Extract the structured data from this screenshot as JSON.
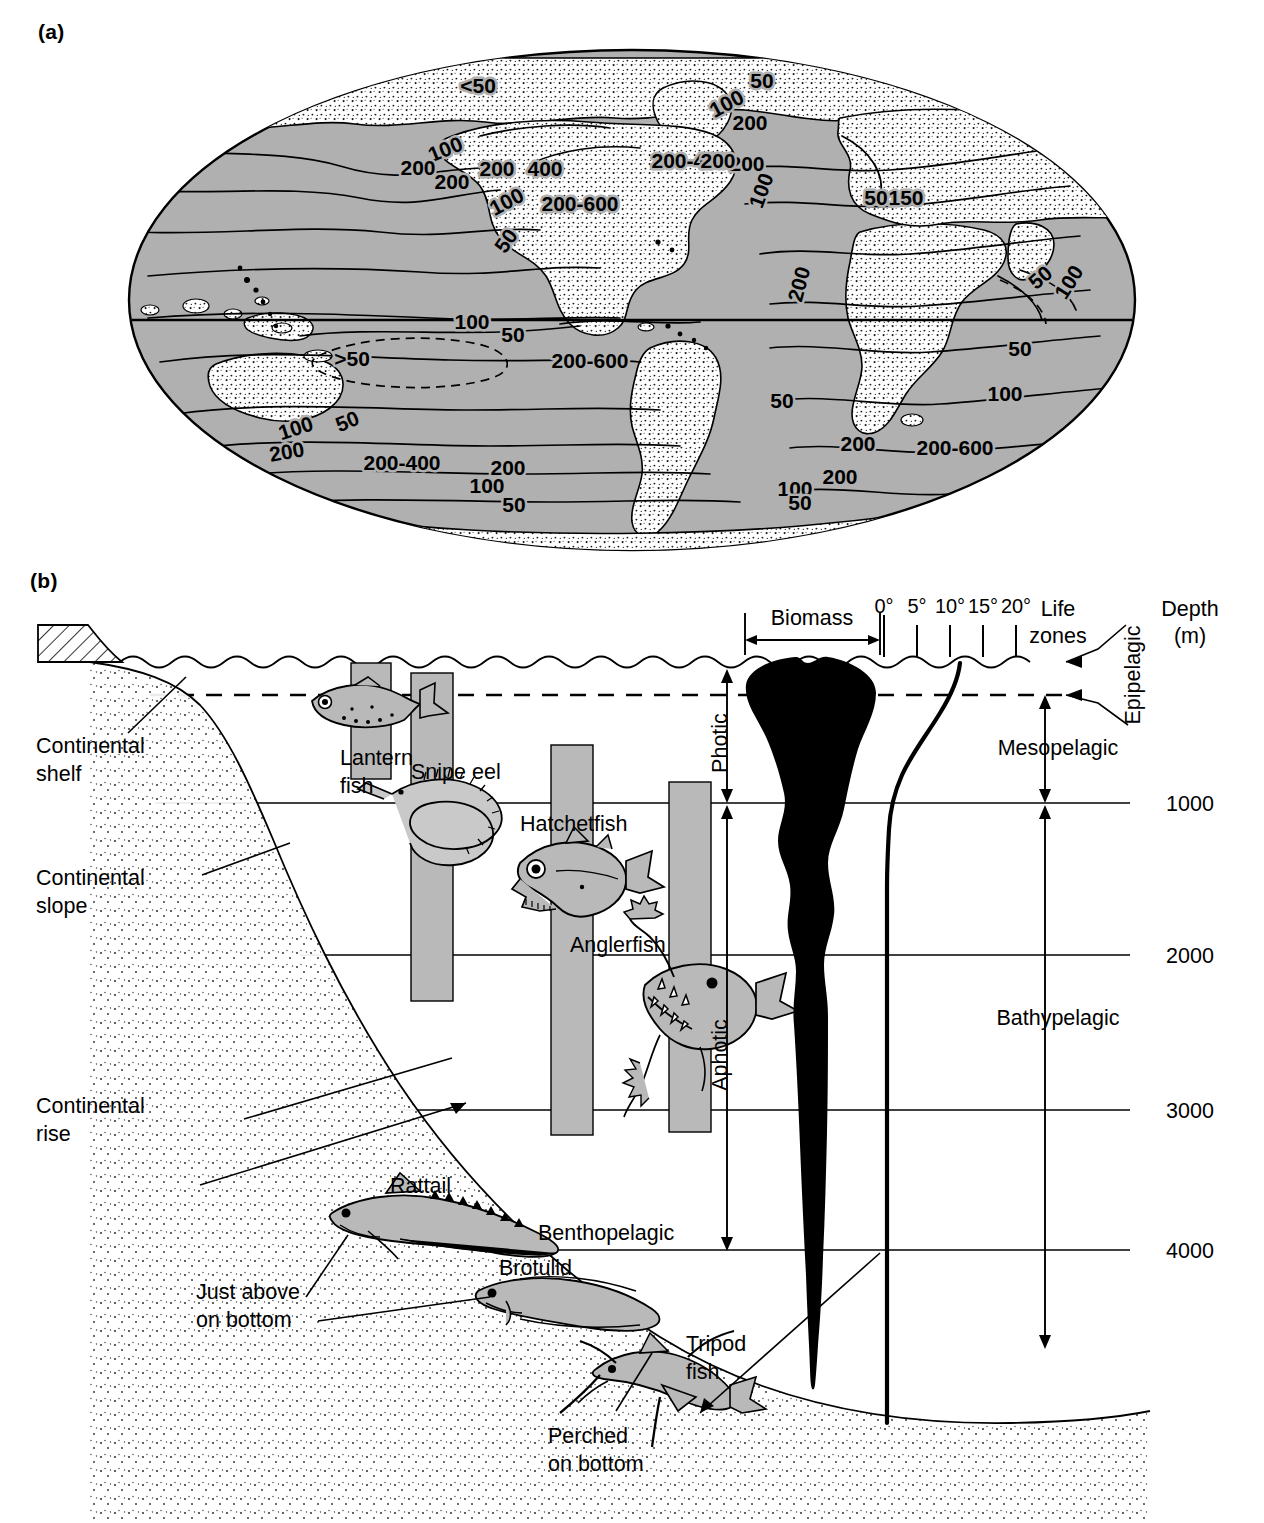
{
  "figure": {
    "panel_a_label": "(a)",
    "panel_b_label": "(b)"
  },
  "panel_a": {
    "description": "World map of annual primary productivity (gC/m2/yr) with contour lines",
    "contour_labels": [
      {
        "id": "c1",
        "text": "<50",
        "x": 478,
        "y": 75,
        "rotate": 0
      },
      {
        "id": "c2",
        "text": "50",
        "x": 762,
        "y": 70,
        "rotate": 0
      },
      {
        "id": "c3",
        "text": "100",
        "x": 730,
        "y": 92,
        "rotate": -28
      },
      {
        "id": "c4",
        "text": "200",
        "x": 750,
        "y": 112,
        "rotate": 0
      },
      {
        "id": "c5",
        "text": "100",
        "x": 448,
        "y": 138,
        "rotate": -22
      },
      {
        "id": "c6",
        "text": "200",
        "x": 418,
        "y": 157,
        "rotate": 0
      },
      {
        "id": "c7",
        "text": "200",
        "x": 452,
        "y": 171,
        "rotate": 0
      },
      {
        "id": "c8",
        "text": "200",
        "x": 497,
        "y": 158,
        "rotate": 0
      },
      {
        "id": "c9",
        "text": "400",
        "x": 545,
        "y": 158,
        "rotate": 0
      },
      {
        "id": "c10",
        "text": "200-400",
        "x": 690,
        "y": 150,
        "rotate": 0
      },
      {
        "id": "c11",
        "text": "200",
        "x": 747,
        "y": 153,
        "rotate": 0
      },
      {
        "id": "c12",
        "text": "100",
        "x": 510,
        "y": 190,
        "rotate": -28
      },
      {
        "id": "c13",
        "text": "200-600",
        "x": 580,
        "y": 193,
        "rotate": 0
      },
      {
        "id": "c14",
        "text": "100",
        "x": 768,
        "y": 175,
        "rotate": -70
      },
      {
        "id": "c15",
        "text": "50",
        "x": 512,
        "y": 227,
        "rotate": -55
      },
      {
        "id": "c16",
        "text": "50",
        "x": 876,
        "y": 187,
        "rotate": 0
      },
      {
        "id": "c17",
        "text": "150",
        "x": 906,
        "y": 187,
        "rotate": 0
      },
      {
        "id": "c18",
        "text": "200",
        "x": 806,
        "y": 268,
        "rotate": -75
      },
      {
        "id": "c19",
        "text": "50",
        "x": 1045,
        "y": 265,
        "rotate": -40
      },
      {
        "id": "c20",
        "text": "100",
        "x": 1075,
        "y": 268,
        "rotate": -58
      },
      {
        "id": "c21",
        "text": "100",
        "x": 472,
        "y": 311,
        "rotate": 0
      },
      {
        "id": "c22",
        "text": "50",
        "x": 513,
        "y": 324,
        "rotate": 0
      },
      {
        "id": "c23",
        "text": ">50",
        "x": 352,
        "y": 348,
        "rotate": 0
      },
      {
        "id": "c24",
        "text": "200-600",
        "x": 590,
        "y": 350,
        "rotate": 0
      },
      {
        "id": "c25",
        "text": "50",
        "x": 350,
        "y": 410,
        "rotate": -22
      },
      {
        "id": "c26",
        "text": "100",
        "x": 298,
        "y": 417,
        "rotate": -18
      },
      {
        "id": "c27",
        "text": "200",
        "x": 288,
        "y": 441,
        "rotate": -10
      },
      {
        "id": "c28",
        "text": "200-400",
        "x": 402,
        "y": 452,
        "rotate": 0
      },
      {
        "id": "c29",
        "text": "200",
        "x": 508,
        "y": 457,
        "rotate": 0
      },
      {
        "id": "c30",
        "text": "100",
        "x": 487,
        "y": 475,
        "rotate": 0
      },
      {
        "id": "c31",
        "text": "50",
        "x": 514,
        "y": 494,
        "rotate": 0
      },
      {
        "id": "c32",
        "text": "100",
        "x": 795,
        "y": 478,
        "rotate": 0
      },
      {
        "id": "c33",
        "text": "200",
        "x": 840,
        "y": 466,
        "rotate": 0
      },
      {
        "id": "c34",
        "text": "50",
        "x": 800,
        "y": 492,
        "rotate": 0
      },
      {
        "id": "c35",
        "text": "50",
        "x": 1020,
        "y": 338,
        "rotate": 0
      },
      {
        "id": "c36",
        "text": "100",
        "x": 1005,
        "y": 383,
        "rotate": 0
      },
      {
        "id": "c37",
        "text": "200",
        "x": 858,
        "y": 433,
        "rotate": 0
      },
      {
        "id": "c38",
        "text": "200-600",
        "x": 955,
        "y": 437,
        "rotate": 0
      },
      {
        "id": "c39",
        "text": "50",
        "x": 782,
        "y": 390,
        "rotate": 0
      },
      {
        "id": "c40",
        "text": "200",
        "x": 718,
        "y": 150,
        "rotate": 0
      }
    ],
    "colors": {
      "ocean": "#b0b0b0",
      "land": "#ffffff",
      "outline": "#000000"
    }
  },
  "panel_b": {
    "title_labels": {
      "biomass": "Biomass",
      "life_zones": "Life\nzones",
      "life_zones_line1": "Life",
      "life_zones_line2": "zones",
      "depth_line1": "Depth",
      "depth_line2": "(m)"
    },
    "temperature_axis": {
      "ticks": [
        "0°",
        "5°",
        "10°",
        "15°",
        "20°"
      ],
      "unit": "degrees Celsius"
    },
    "depth_scale": {
      "values": [
        "1000",
        "2000",
        "3000",
        "4000"
      ],
      "unit": "m"
    },
    "light_zones": [
      {
        "name": "Photic",
        "from_m": 0,
        "to_m": 1000
      },
      {
        "name": "Aphotic",
        "from_m": 1000,
        "to_m": 4000
      }
    ],
    "life_zones": [
      {
        "name": "Epipelagic",
        "from_m": 0,
        "to_m": 200
      },
      {
        "name": "Mesopelagic",
        "from_m": 200,
        "to_m": 1000
      },
      {
        "name": "Bathypelagic",
        "from_m": 1000,
        "to_m": 4000
      }
    ],
    "seafloor_labels": [
      {
        "id": "shelf",
        "line1": "Continental",
        "line2": "shelf"
      },
      {
        "id": "slope",
        "line1": "Continental",
        "line2": "slope"
      },
      {
        "id": "rise",
        "line1": "Continental",
        "line2": "rise"
      }
    ],
    "benthic_labels": [
      {
        "id": "benthopelagic",
        "text": "Benthopelagic"
      },
      {
        "id": "just-above",
        "line1": "Just above",
        "line2": "bottom"
      },
      {
        "id": "perched",
        "line1": "Perched",
        "line2": "on bottom"
      }
    ],
    "organisms": [
      {
        "id": "lantern-fish",
        "line1": "Lantern",
        "line2": "fish",
        "label": "Lantern fish"
      },
      {
        "id": "snipe-eel",
        "label": "Snipe eel"
      },
      {
        "id": "hatchetfish",
        "label": "Hatchetfish"
      },
      {
        "id": "anglerfish",
        "label": "Anglerfish"
      },
      {
        "id": "rattail",
        "label": "Rattail"
      },
      {
        "id": "brotulid",
        "label": "Brotulid"
      },
      {
        "id": "tripod-fish",
        "line1": "Tripod",
        "line2": "fish",
        "label": "Tripod fish"
      }
    ],
    "colors": {
      "fish_body": "#b9b9b9",
      "depth_bar": "#b9b9b9",
      "biomass_curve": "#000000",
      "sediment": "#f2f2f2"
    }
  },
  "chart_data": {
    "type": "area",
    "xlabel": "Temperature (°C) / relative biomass",
    "ylabel": "Depth (m)",
    "ylim": [
      0,
      4500
    ],
    "grid": true,
    "legend": "none",
    "depth_gridlines": [
      1000,
      2000,
      3000,
      4000
    ],
    "temperature_ticks": [
      0,
      5,
      10,
      15,
      20
    ],
    "series": [
      {
        "name": "Biomass",
        "comment": "Relative biomass half-width as a function of depth (m)",
        "depths_m": [
          0,
          50,
          100,
          150,
          200,
          300,
          450,
          600,
          700,
          800,
          900,
          1000,
          1100,
          1400,
          2000,
          2600,
          3200,
          3800,
          4200,
          4400
        ],
        "values": [
          46,
          52,
          50,
          44,
          38,
          28,
          20,
          22,
          26,
          24,
          18,
          11,
          7,
          6,
          5.5,
          5,
          4,
          3,
          1.5,
          0
        ]
      },
      {
        "name": "Temperature",
        "comment": "Water temperature in degrees C at depth",
        "depths_m": [
          0,
          100,
          200,
          400,
          600,
          800,
          1000,
          1500,
          2000,
          3000,
          4000,
          4400
        ],
        "values": [
          20.5,
          19.5,
          17.0,
          12.0,
          8.5,
          6.0,
          5.0,
          4.4,
          4.2,
          4.0,
          4.0,
          4.0
        ]
      }
    ],
    "depth_ranges": [
      {
        "organism": "Lantern fish",
        "from_m": 0,
        "to_m": 750
      },
      {
        "organism": "Snipe eel",
        "from_m": 50,
        "to_m": 2200
      },
      {
        "organism": "Hatchetfish",
        "from_m": 280,
        "to_m": 2700
      },
      {
        "organism": "Anglerfish",
        "from_m": 750,
        "to_m": 3200
      }
    ]
  }
}
